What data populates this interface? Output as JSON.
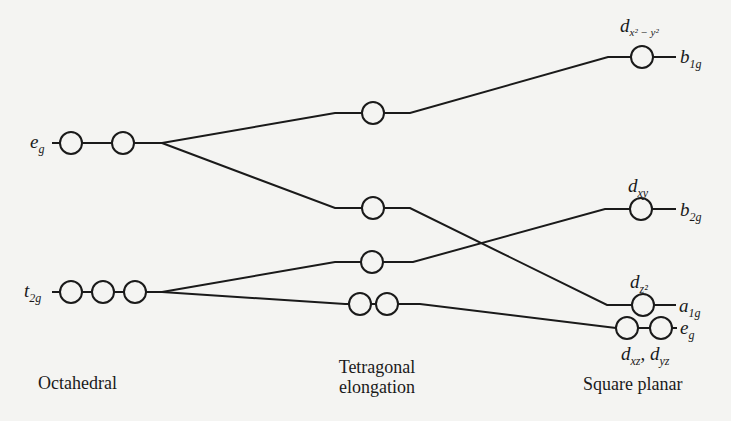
{
  "diagram": {
    "columns": [
      {
        "id": "octahedral",
        "caption": "Octahedral"
      },
      {
        "id": "tetragonal",
        "caption_line1": "Tetragonal",
        "caption_line2": "elongation"
      },
      {
        "id": "square",
        "caption": "Square planar"
      }
    ],
    "octahedral_levels": [
      {
        "label": "e",
        "sub": "g",
        "orbitals": 2
      },
      {
        "label": "t",
        "sub": "2g",
        "orbitals": 3
      }
    ],
    "tetragonal_levels": [
      {
        "orbitals": 1,
        "order": 1
      },
      {
        "orbitals": 1,
        "order": 2
      },
      {
        "orbitals": 1,
        "order": 3
      },
      {
        "orbitals": 2,
        "order": 4
      }
    ],
    "square_planar_levels": [
      {
        "orbital": "d",
        "orbital_sub": "x² − y²",
        "symmetry": "b",
        "symmetry_sub": "1g",
        "orbitals": 1
      },
      {
        "orbital": "d",
        "orbital_sub": "xy",
        "symmetry": "b",
        "symmetry_sub": "2g",
        "orbitals": 1
      },
      {
        "orbital": "d",
        "orbital_sub": "z²",
        "symmetry": "a",
        "symmetry_sub": "1g",
        "orbitals": 1
      },
      {
        "orbital_a": "d",
        "orbital_a_sub": "xz",
        "separator": ", ",
        "orbital_b": "d",
        "orbital_b_sub": "yz",
        "symmetry": "e",
        "symmetry_sub": "g",
        "orbitals": 2
      }
    ]
  }
}
